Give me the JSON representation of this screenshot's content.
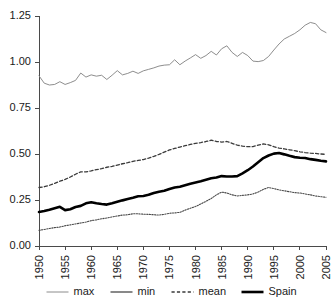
{
  "chart_data": {
    "type": "line",
    "title": "",
    "subtitle": "",
    "xlabel": "",
    "ylabel": "",
    "xlim": [
      1950,
      2005
    ],
    "ylim": [
      0.0,
      1.25
    ],
    "grid": false,
    "legend_position": "bottom",
    "x_ticks": [
      "1950",
      "1955",
      "1960",
      "1965",
      "1970",
      "1975",
      "1980",
      "1985",
      "1990",
      "1995",
      "2000",
      "2005"
    ],
    "y_ticks": [
      "0.00",
      "0.25",
      "0.50",
      "0.75",
      "1.00",
      "1.25"
    ],
    "x": [
      1950,
      1951,
      1952,
      1953,
      1954,
      1955,
      1956,
      1957,
      1958,
      1959,
      1960,
      1961,
      1962,
      1963,
      1964,
      1965,
      1966,
      1967,
      1968,
      1969,
      1970,
      1971,
      1972,
      1973,
      1974,
      1975,
      1976,
      1977,
      1978,
      1979,
      1980,
      1981,
      1982,
      1983,
      1984,
      1985,
      1986,
      1987,
      1988,
      1989,
      1990,
      1991,
      1992,
      1993,
      1994,
      1995,
      1996,
      1997,
      1998,
      1999,
      2000,
      2001,
      2002,
      2003,
      2004,
      2005
    ],
    "series": [
      {
        "name": "max",
        "style": "thin-light",
        "color": "#808080",
        "values": [
          0.925,
          0.885,
          0.875,
          0.878,
          0.893,
          0.878,
          0.888,
          0.9,
          0.94,
          0.918,
          0.93,
          0.923,
          0.928,
          0.905,
          0.928,
          0.953,
          0.93,
          0.938,
          0.95,
          0.938,
          0.952,
          0.96,
          0.968,
          0.978,
          0.983,
          0.985,
          1.012,
          0.985,
          1.005,
          1.022,
          1.04,
          1.02,
          1.035,
          1.058,
          1.038,
          1.072,
          1.088,
          1.052,
          1.03,
          1.052,
          1.035,
          1.005,
          1.002,
          1.008,
          1.03,
          1.065,
          1.098,
          1.125,
          1.14,
          1.155,
          1.175,
          1.2,
          1.215,
          1.208,
          1.175,
          1.16
        ]
      },
      {
        "name": "min",
        "style": "fine-dotted",
        "color": "#4a4a4a",
        "values": [
          0.085,
          0.09,
          0.095,
          0.1,
          0.103,
          0.11,
          0.115,
          0.12,
          0.125,
          0.13,
          0.138,
          0.142,
          0.148,
          0.152,
          0.158,
          0.163,
          0.168,
          0.17,
          0.175,
          0.175,
          0.173,
          0.172,
          0.17,
          0.168,
          0.172,
          0.178,
          0.18,
          0.183,
          0.195,
          0.205,
          0.215,
          0.228,
          0.243,
          0.258,
          0.278,
          0.293,
          0.288,
          0.278,
          0.272,
          0.275,
          0.278,
          0.283,
          0.293,
          0.308,
          0.318,
          0.312,
          0.305,
          0.3,
          0.295,
          0.29,
          0.288,
          0.283,
          0.278,
          0.272,
          0.268,
          0.265
        ]
      },
      {
        "name": "mean",
        "style": "dashed",
        "color": "#3a3a3a",
        "values": [
          0.318,
          0.322,
          0.33,
          0.34,
          0.352,
          0.362,
          0.375,
          0.39,
          0.403,
          0.403,
          0.408,
          0.415,
          0.42,
          0.428,
          0.433,
          0.44,
          0.447,
          0.453,
          0.46,
          0.465,
          0.47,
          0.478,
          0.487,
          0.498,
          0.51,
          0.522,
          0.53,
          0.538,
          0.545,
          0.552,
          0.558,
          0.562,
          0.568,
          0.575,
          0.568,
          0.565,
          0.568,
          0.558,
          0.548,
          0.543,
          0.54,
          0.54,
          0.548,
          0.555,
          0.55,
          0.54,
          0.532,
          0.528,
          0.523,
          0.518,
          0.512,
          0.508,
          0.505,
          0.503,
          0.5,
          0.498
        ]
      },
      {
        "name": "Spain",
        "style": "thick-black",
        "color": "#000000",
        "values": [
          0.185,
          0.19,
          0.197,
          0.205,
          0.213,
          0.195,
          0.2,
          0.212,
          0.218,
          0.232,
          0.238,
          0.232,
          0.228,
          0.225,
          0.232,
          0.24,
          0.248,
          0.255,
          0.262,
          0.27,
          0.272,
          0.278,
          0.288,
          0.295,
          0.3,
          0.31,
          0.318,
          0.322,
          0.33,
          0.338,
          0.345,
          0.352,
          0.36,
          0.368,
          0.372,
          0.38,
          0.378,
          0.378,
          0.38,
          0.395,
          0.412,
          0.432,
          0.455,
          0.478,
          0.492,
          0.502,
          0.505,
          0.498,
          0.49,
          0.483,
          0.48,
          0.478,
          0.472,
          0.468,
          0.463,
          0.46
        ]
      }
    ],
    "legend": [
      {
        "label": "max",
        "style": "thin-light",
        "color": "#808080"
      },
      {
        "label": "min",
        "style": "medium",
        "color": "#4a4a4a"
      },
      {
        "label": "mean",
        "style": "dashed",
        "color": "#3a3a3a"
      },
      {
        "label": "Spain",
        "style": "thick-black",
        "color": "#000000"
      }
    ]
  }
}
